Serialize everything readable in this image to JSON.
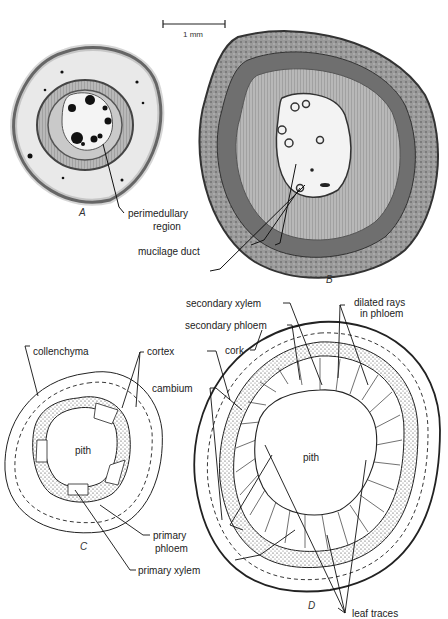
{
  "figure": {
    "scale_bar": {
      "label": "1 mm"
    },
    "panels": [
      {
        "id": "A",
        "label": "A",
        "type": "micrograph"
      },
      {
        "id": "B",
        "label": "B",
        "type": "micrograph"
      },
      {
        "id": "C",
        "label": "C",
        "type": "drawing"
      },
      {
        "id": "D",
        "label": "D",
        "type": "drawing"
      }
    ],
    "labels": {
      "perimedullary_1": "perimedullary",
      "perimedullary_2": "region",
      "mucilage_duct": "mucilage duct",
      "secondary_xylem": "secondary xylem",
      "secondary_phloem": "secondary phloem",
      "dilated_rays_1": "dilated rays",
      "dilated_rays_2": "in phloem",
      "collenchyma": "collenchyma",
      "cortex": "cortex",
      "cork": "cork",
      "cambium": "cambium",
      "pith_c": "pith",
      "pith_d": "pith",
      "primary_phloem_1": "primary",
      "primary_phloem_2": "phloem",
      "primary_xylem": "primary xylem",
      "leaf_traces": "leaf traces"
    },
    "colors": {
      "ink": "#1a1a1a",
      "tissue_dark": "#5a5a5a",
      "tissue_mid": "#8f8f8f",
      "tissue_light": "#d8d8d8",
      "pith_light": "#f2f2f2"
    }
  }
}
